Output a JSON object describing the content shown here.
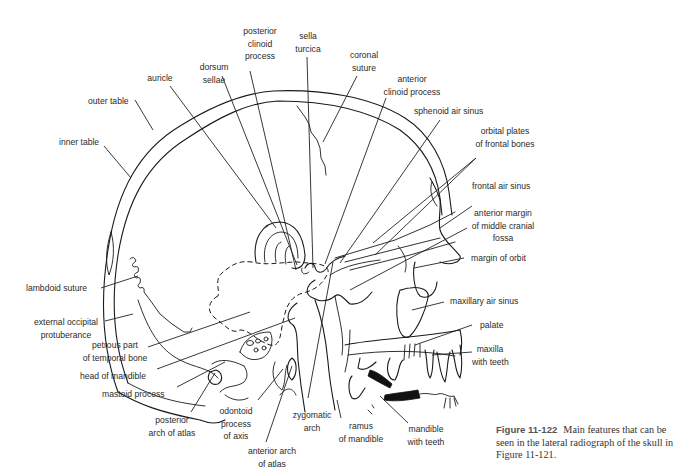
{
  "figure": {
    "caption": {
      "number": "Figure 11-122",
      "text": "Main features that can be seen in the lateral radiograph of the skull in Figure 11-121."
    },
    "labels": {
      "posterior_clinoid_process": [
        "posterior",
        "clinoid",
        "process"
      ],
      "sella_turcica": [
        "sella",
        "turcica"
      ],
      "coronal_suture": [
        "coronal",
        "suture"
      ],
      "dorsum_sellae": [
        "dorsum",
        "sellae"
      ],
      "anterior_clinoid_process": [
        "anterior",
        "clinoid process"
      ],
      "auricle": [
        "auricle"
      ],
      "outer_table": [
        "outer table"
      ],
      "inner_table": [
        "inner table"
      ],
      "sphenoid_air_sinus": [
        "sphenoid air sinus"
      ],
      "orbital_plates": [
        "orbital plates",
        "of frontal bones"
      ],
      "frontal_air_sinus": [
        "frontal air sinus"
      ],
      "anterior_margin_mcf": [
        "anterior margin",
        "of middle cranial",
        "fossa"
      ],
      "margin_of_orbit": [
        "margin of orbit"
      ],
      "lambdoid_suture": [
        "lambdoid suture"
      ],
      "maxillary_air_sinus": [
        "maxillary air sinus"
      ],
      "external_occipital_protuberance": [
        "external occipital",
        "protuberance"
      ],
      "palate": [
        "palate"
      ],
      "petrous_part": [
        "petrous part",
        "of temporal bone"
      ],
      "maxilla_with_teeth": [
        "maxilla",
        "with teeth"
      ],
      "head_of_mandible": [
        "head of mandible"
      ],
      "mastoid_process": [
        "mastoid process"
      ],
      "posterior_arch_of_atlas": [
        "posterior",
        "arch of atlas"
      ],
      "odontoid_process": [
        "odontoid",
        "process",
        "of axis"
      ],
      "zygomatic_arch": [
        "zygomatic",
        "arch"
      ],
      "ramus_of_mandible": [
        "ramus",
        "of mandible"
      ],
      "mandible_with_teeth": [
        "mandible",
        "with teeth"
      ],
      "anterior_arch_of_atlas": [
        "anterior arch",
        "of atlas"
      ]
    }
  }
}
